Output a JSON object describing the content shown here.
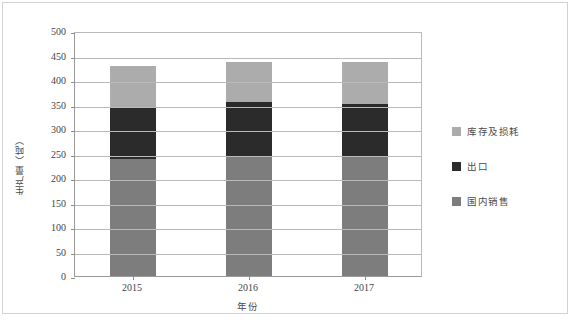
{
  "chart_data": {
    "type": "bar",
    "subtype": "stacked-bar",
    "title": "",
    "xlabel": "年份",
    "ylabel": "生产量（吨）",
    "categories": [
      "2015",
      "2016",
      "2017"
    ],
    "series": [
      {
        "name": "国内销售",
        "values": [
          239,
          245,
          245
        ],
        "color": "#7d7d7d"
      },
      {
        "name": "出口",
        "values": [
          106,
          110,
          107
        ],
        "color": "#2b2b2b"
      },
      {
        "name": "库存及损耗",
        "values": [
          83,
          82,
          85
        ],
        "color": "#acacac"
      }
    ],
    "stack_totals": [
      428,
      437,
      437
    ],
    "stack_boundaries": {
      "2015": {
        "domestic_top": 239,
        "export_top": 345,
        "inventory_top": 428
      },
      "2016": {
        "domestic_top": 245,
        "export_top": 355,
        "inventory_top": 437
      },
      "2017": {
        "domestic_top": 245,
        "export_top": 352,
        "inventory_top": 437
      }
    },
    "ylim": [
      0,
      500
    ],
    "ytick_interval": 50,
    "yticks": [
      "500",
      "450",
      "400",
      "350",
      "300",
      "250",
      "200",
      "150",
      "100",
      "50",
      "0"
    ],
    "ytick_values": [
      500,
      450,
      400,
      350,
      300,
      250,
      200,
      150,
      100,
      50,
      0
    ],
    "grid": true,
    "grid_axis": "y",
    "legend_position": "right",
    "legend_order_top_to_bottom": [
      "库存及损耗",
      "出口",
      "国内销售"
    ]
  },
  "axes": {
    "y_title": "生产量（吨）",
    "x_title": "年份"
  },
  "legend": {
    "items": [
      {
        "label": "库存及损耗",
        "color": "#acacac"
      },
      {
        "label": "出口",
        "color": "#2b2b2b"
      },
      {
        "label": "国内销售",
        "color": "#7d7d7d"
      }
    ]
  },
  "colors": {
    "inventory_loss": "#acacac",
    "export": "#2b2b2b",
    "domestic_sales": "#7d7d7d",
    "gridline": "#b9b9b9",
    "axis": "#9a9a9a",
    "frame": "#d2d2d2",
    "text": "#444444",
    "background": "#ffffff"
  }
}
